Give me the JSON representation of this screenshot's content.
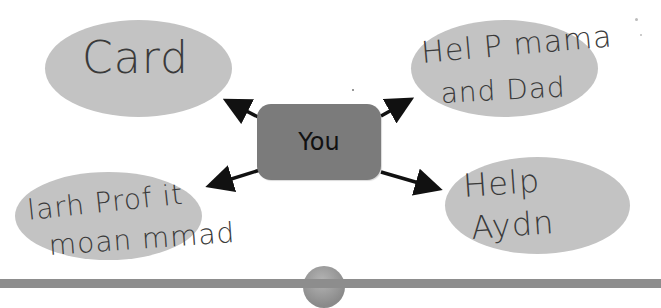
{
  "diagram": {
    "type": "mind-map",
    "center": {
      "label": "You",
      "fill": "#7b7b7b"
    },
    "nodes": [
      {
        "id": "top-left",
        "text_lines": [
          "Card"
        ],
        "fill": "#c3c3c3"
      },
      {
        "id": "top-right",
        "text_lines": [
          "Hel P mama",
          "and Dad"
        ],
        "fill": "#c3c3c3"
      },
      {
        "id": "bottom-left",
        "text_lines": [
          "larh Prof it",
          "moan mmad"
        ],
        "fill": "#c3c3c3"
      },
      {
        "id": "bottom-right",
        "text_lines": [
          "Help",
          "Aydn"
        ],
        "fill": "#c3c3c3"
      }
    ],
    "edges": [
      {
        "from": "center",
        "to": "top-left"
      },
      {
        "from": "center",
        "to": "top-right"
      },
      {
        "from": "center",
        "to": "bottom-left"
      },
      {
        "from": "center",
        "to": "bottom-right"
      }
    ],
    "bar_color": "#8d8d8d"
  }
}
